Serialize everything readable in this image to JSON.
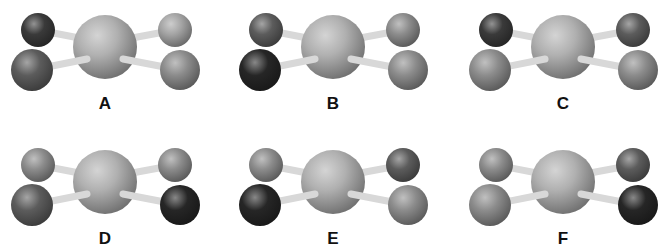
{
  "figure": {
    "shades": {
      "darkest": "#262626",
      "dark": "#3a3a3a",
      "medium_dark": "#5c5c5c",
      "medium": "#8c8c8c",
      "light": "#a4a4a4",
      "center": "#b0b0b0",
      "bond": "#d8d8d8"
    },
    "molecules": [
      {
        "label": "A",
        "cx": 105,
        "cy": 47,
        "left_top": "dark",
        "left_bottom": "medium_dark",
        "right_top": "light",
        "right_bottom": "medium"
      },
      {
        "label": "B",
        "cx": 333,
        "cy": 47,
        "left_top": "medium_dark",
        "left_bottom": "darkest",
        "right_top": "medium",
        "right_bottom": "medium"
      },
      {
        "label": "C",
        "cx": 563,
        "cy": 47,
        "left_top": "dark",
        "left_bottom": "medium",
        "right_top": "medium_dark",
        "right_bottom": "medium"
      },
      {
        "label": "D",
        "cx": 105,
        "cy": 182,
        "left_top": "medium",
        "left_bottom": "medium_dark",
        "right_top": "medium",
        "right_bottom": "darkest"
      },
      {
        "label": "E",
        "cx": 333,
        "cy": 182,
        "left_top": "medium",
        "left_bottom": "darkest",
        "right_top": "medium_dark",
        "right_bottom": "medium"
      },
      {
        "label": "F",
        "cx": 563,
        "cy": 182,
        "left_top": "medium",
        "left_bottom": "medium",
        "right_top": "medium_dark",
        "right_bottom": "darkest"
      }
    ]
  }
}
